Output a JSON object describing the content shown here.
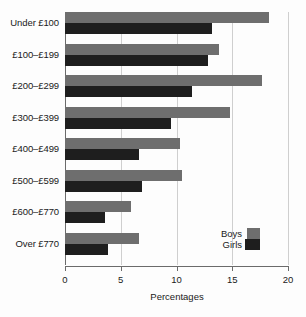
{
  "chart_data": {
    "type": "bar",
    "orientation": "horizontal",
    "title": "",
    "xlabel": "Percentages",
    "ylabel": "",
    "xlim": [
      0,
      20
    ],
    "xticks": [
      0,
      5,
      10,
      15,
      20
    ],
    "xtick_labels": [
      "0",
      "5",
      "10",
      "15",
      "20"
    ],
    "grid": true,
    "legend_position": "bottom-right",
    "categories": [
      "Under £100",
      "£100–£199",
      "£200–£299",
      "£300–£399",
      "£400–£499",
      "£500–£599",
      "£600–£770",
      "Over £770"
    ],
    "series": [
      {
        "name": "Boys",
        "color": "#6e6e6e",
        "values": [
          18.3,
          13.8,
          17.7,
          14.8,
          10.3,
          10.5,
          5.9,
          6.6
        ]
      },
      {
        "name": "Girls",
        "color": "#1e1e1e",
        "values": [
          13.2,
          12.8,
          11.4,
          9.5,
          6.6,
          6.9,
          3.6,
          3.9
        ]
      }
    ]
  },
  "legend": {
    "items": [
      {
        "label": "Boys",
        "color": "#6e6e6e"
      },
      {
        "label": "Girls",
        "color": "#1e1e1e"
      }
    ]
  },
  "colors": {
    "boys": "#6e6e6e",
    "girls": "#1e1e1e",
    "axis": "#6b6b6b",
    "grid": "#cfcfcf",
    "background": "#fdfdfd",
    "text": "#1a1a1a"
  }
}
